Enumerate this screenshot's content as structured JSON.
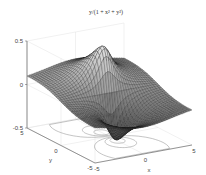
{
  "chart_data": {
    "type": "surface",
    "title": "y/(1 + x² + y²)",
    "function": "z = y / (1 + x^2 + y^2)",
    "xlabel": "x",
    "ylabel": "y",
    "zlabel": "",
    "xlim": [
      -5,
      5
    ],
    "ylim": [
      -5,
      5
    ],
    "zlim": [
      -0.5,
      0.5
    ],
    "x_ticks": [
      "-5",
      "0",
      "5"
    ],
    "y_ticks": [
      "-5",
      "0",
      "5"
    ],
    "z_ticks": [
      "-0.5",
      "0",
      "0.5"
    ],
    "grid": true,
    "contour_on_base": true,
    "colormap": "gray",
    "grid_resolution": 40
  },
  "colors": {
    "background": "#ffffff",
    "axis": "#555555",
    "grid": "#e2e2e2",
    "mesh": "#1a1a1a",
    "contour": "#8a8a8a"
  }
}
